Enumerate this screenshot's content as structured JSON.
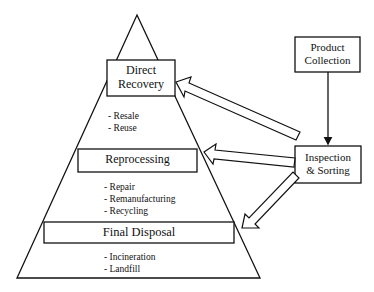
{
  "diagram": {
    "title": "",
    "pyramid": {
      "levels": [
        {
          "id": "direct-recovery",
          "label_line1": "Direct",
          "label_line2": "Recovery",
          "items": [
            "- Resale",
            "- Reuse"
          ]
        },
        {
          "id": "reprocessing",
          "label": "Reprocessing",
          "items": [
            "- Repair",
            "- Remanufacturing",
            "- Recycling"
          ]
        },
        {
          "id": "final-disposal",
          "label": "Final Disposal",
          "items": [
            "- Incineration",
            "- Landfill"
          ]
        }
      ]
    },
    "nodes": {
      "product_collection": {
        "label_line1": "Product",
        "label_line2": "Collection"
      },
      "inspection_sorting": {
        "label_line1": "Inspection",
        "label_line2": "& Sorting"
      }
    },
    "edges": [
      {
        "from": "Product Collection",
        "to": "Inspection & Sorting",
        "style": "thin-arrow"
      },
      {
        "from": "Inspection & Sorting",
        "to": "Direct Recovery",
        "style": "block-arrow"
      },
      {
        "from": "Inspection & Sorting",
        "to": "Reprocessing",
        "style": "block-arrow"
      },
      {
        "from": "Inspection & Sorting",
        "to": "Final Disposal",
        "style": "block-arrow"
      }
    ],
    "colors": {
      "stroke": "#111111",
      "fill": "#ffffff"
    }
  }
}
